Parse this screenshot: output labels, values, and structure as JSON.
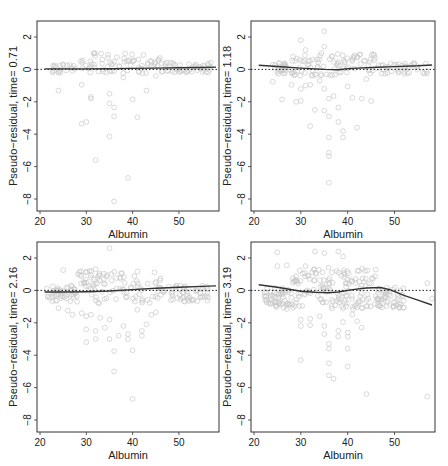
{
  "figure": {
    "panels": 4,
    "layout": "2x2"
  },
  "chart_data": [
    {
      "type": "scatter",
      "title": "",
      "xlabel": "Albumin",
      "ylabel": "Pseudo−residual, time= 0.71",
      "xlim": [
        20,
        58
      ],
      "ylim": [
        -8.5,
        2.9
      ],
      "xticks": [
        20,
        30,
        40,
        50
      ],
      "yticks": [
        2,
        0,
        -2,
        -4,
        -6,
        -8
      ],
      "reference_line": {
        "y": 0,
        "style": "dotted"
      },
      "smooth": {
        "x": [
          21,
          25,
          30,
          35,
          40,
          45,
          50,
          55,
          58
        ],
        "y": [
          0.03,
          0.03,
          0.03,
          0.04,
          0.06,
          0.08,
          0.1,
          0.12,
          0.14
        ]
      },
      "outliers": [
        {
          "x": 24,
          "y": -1.3
        },
        {
          "x": 29,
          "y": -0.95
        },
        {
          "x": 31,
          "y": -1.7
        },
        {
          "x": 31,
          "y": -1.8
        },
        {
          "x": 35,
          "y": -1.5
        },
        {
          "x": 35,
          "y": -2.1
        },
        {
          "x": 36,
          "y": -2.35
        },
        {
          "x": 36,
          "y": -2.9
        },
        {
          "x": 40,
          "y": -1.85
        },
        {
          "x": 41,
          "y": -2.95
        },
        {
          "x": 43,
          "y": -1.3
        },
        {
          "x": 29,
          "y": -3.35
        },
        {
          "x": 30,
          "y": -3.25
        },
        {
          "x": 35,
          "y": -4.15
        },
        {
          "x": 32,
          "y": -5.6
        },
        {
          "x": 39,
          "y": -6.7
        },
        {
          "x": 36,
          "y": -8.15
        },
        {
          "x": 38,
          "y": -0.5
        },
        {
          "x": 45,
          "y": -0.4
        }
      ],
      "cluster": {
        "x_range": [
          22,
          57
        ],
        "y_range": [
          -0.3,
          1.0
        ],
        "count": 140,
        "seed": 11
      }
    },
    {
      "type": "scatter",
      "title": "",
      "xlabel": "Albumin",
      "ylabel": "Pseudo−residual, time= 1.18",
      "xlim": [
        20,
        58
      ],
      "ylim": [
        -8.5,
        2.9
      ],
      "xticks": [
        20,
        30,
        40,
        50
      ],
      "yticks": [
        2,
        0,
        -2,
        -4,
        -6,
        -8
      ],
      "reference_line": {
        "y": 0,
        "style": "dotted"
      },
      "smooth": {
        "x": [
          21,
          25,
          30,
          35,
          38,
          40,
          45,
          50,
          55,
          58
        ],
        "y": [
          0.25,
          0.18,
          0.08,
          0.0,
          -0.02,
          0.05,
          0.12,
          0.17,
          0.22,
          0.27
        ]
      },
      "outliers": [
        {
          "x": 24,
          "y": -0.75
        },
        {
          "x": 26,
          "y": -1.85
        },
        {
          "x": 28,
          "y": -0.95
        },
        {
          "x": 29,
          "y": -2.0
        },
        {
          "x": 30,
          "y": -1.95
        },
        {
          "x": 30,
          "y": -1.2
        },
        {
          "x": 31,
          "y": -1.0
        },
        {
          "x": 32,
          "y": -0.95
        },
        {
          "x": 33,
          "y": -2.5
        },
        {
          "x": 32,
          "y": -3.5
        },
        {
          "x": 34,
          "y": -0.7
        },
        {
          "x": 35,
          "y": -1.2
        },
        {
          "x": 35,
          "y": -2.55
        },
        {
          "x": 36,
          "y": -1.8
        },
        {
          "x": 36,
          "y": -2.9
        },
        {
          "x": 37,
          "y": -1.65
        },
        {
          "x": 38,
          "y": -2.35
        },
        {
          "x": 38,
          "y": -3.25
        },
        {
          "x": 39,
          "y": -3.8
        },
        {
          "x": 39,
          "y": -4.2
        },
        {
          "x": 36,
          "y": -4.2
        },
        {
          "x": 36,
          "y": -5.15
        },
        {
          "x": 36,
          "y": -5.35
        },
        {
          "x": 36,
          "y": -7.0
        },
        {
          "x": 40,
          "y": -1.05
        },
        {
          "x": 41,
          "y": -1.75
        },
        {
          "x": 42,
          "y": -3.6
        },
        {
          "x": 43,
          "y": -1.8
        },
        {
          "x": 45,
          "y": -1.95
        },
        {
          "x": 44,
          "y": -0.6
        },
        {
          "x": 35,
          "y": 2.35
        },
        {
          "x": 30,
          "y": 1.8
        },
        {
          "x": 31,
          "y": 1.2
        },
        {
          "x": 35,
          "y": 1.4
        }
      ],
      "cluster": {
        "x_range": [
          24,
          57
        ],
        "y_range": [
          -0.4,
          1.0
        ],
        "count": 160,
        "seed": 23
      }
    },
    {
      "type": "scatter",
      "title": "",
      "xlabel": "Albumin",
      "ylabel": "Pseudo−residual, time= 2.16",
      "xlim": [
        20,
        58
      ],
      "ylim": [
        -8.5,
        2.9
      ],
      "xticks": [
        20,
        30,
        40,
        50
      ],
      "yticks": [
        2,
        0,
        -2,
        -4,
        -6,
        -8
      ],
      "reference_line": {
        "y": 0,
        "style": "dotted"
      },
      "smooth": {
        "x": [
          21,
          25,
          30,
          35,
          40,
          45,
          50,
          55,
          58
        ],
        "y": [
          -0.1,
          -0.1,
          -0.08,
          -0.04,
          0.05,
          0.13,
          0.2,
          0.25,
          0.28
        ]
      },
      "outliers": [
        {
          "x": 24,
          "y": -1.1
        },
        {
          "x": 26,
          "y": -1.25
        },
        {
          "x": 27,
          "y": -1.5
        },
        {
          "x": 28,
          "y": -0.7
        },
        {
          "x": 29,
          "y": -1.4
        },
        {
          "x": 30,
          "y": -1.6
        },
        {
          "x": 30,
          "y": -2.4
        },
        {
          "x": 30,
          "y": -3.2
        },
        {
          "x": 31,
          "y": -1.5
        },
        {
          "x": 32,
          "y": -2.5
        },
        {
          "x": 32,
          "y": -3.0
        },
        {
          "x": 33,
          "y": -1.7
        },
        {
          "x": 34,
          "y": -2.3
        },
        {
          "x": 35,
          "y": -1.8
        },
        {
          "x": 35,
          "y": -3.0
        },
        {
          "x": 36,
          "y": -3.75
        },
        {
          "x": 36,
          "y": -5.0
        },
        {
          "x": 37,
          "y": -2.8
        },
        {
          "x": 38,
          "y": -2.2
        },
        {
          "x": 39,
          "y": -2.7
        },
        {
          "x": 39,
          "y": -3.0
        },
        {
          "x": 40,
          "y": -3.7
        },
        {
          "x": 40,
          "y": -6.7
        },
        {
          "x": 41,
          "y": -1.2
        },
        {
          "x": 42,
          "y": -2.5
        },
        {
          "x": 42,
          "y": -2.8
        },
        {
          "x": 43,
          "y": -2.1
        },
        {
          "x": 44,
          "y": -1.5
        },
        {
          "x": 45,
          "y": -1.35
        },
        {
          "x": 35,
          "y": 2.6
        },
        {
          "x": 25,
          "y": 1.25
        },
        {
          "x": 32,
          "y": 1.3
        }
      ],
      "cluster": {
        "x_range": [
          21,
          57
        ],
        "y_range": [
          -0.8,
          1.2
        ],
        "count": 200,
        "seed": 37
      }
    },
    {
      "type": "scatter",
      "title": "",
      "xlabel": "Albumin",
      "ylabel": "Pseudo−residual, time= 3.19",
      "xlim": [
        20,
        58
      ],
      "ylim": [
        -8.5,
        2.9
      ],
      "xticks": [
        20,
        30,
        40,
        50
      ],
      "yticks": [
        2,
        0,
        -2,
        -4,
        -6,
        -8
      ],
      "reference_line": {
        "y": 0,
        "style": "dotted"
      },
      "smooth": {
        "x": [
          21,
          25,
          30,
          33,
          36,
          38,
          41,
          44,
          47,
          49,
          52,
          55,
          58
        ],
        "y": [
          0.35,
          0.2,
          -0.05,
          -0.12,
          -0.15,
          -0.1,
          0.05,
          0.15,
          0.18,
          0.05,
          -0.3,
          -0.6,
          -0.9
        ]
      },
      "outliers": [
        {
          "x": 24,
          "y": -0.75
        },
        {
          "x": 26,
          "y": -0.8
        },
        {
          "x": 27,
          "y": -1.15
        },
        {
          "x": 30,
          "y": -1.8
        },
        {
          "x": 30,
          "y": -2.2
        },
        {
          "x": 30,
          "y": -4.3
        },
        {
          "x": 32,
          "y": -1.75
        },
        {
          "x": 32,
          "y": -2.15
        },
        {
          "x": 34,
          "y": -1.6
        },
        {
          "x": 35,
          "y": -2.2
        },
        {
          "x": 35,
          "y": -2.7
        },
        {
          "x": 36,
          "y": -3.3
        },
        {
          "x": 36,
          "y": -3.6
        },
        {
          "x": 36,
          "y": -4.5
        },
        {
          "x": 36,
          "y": -5.25
        },
        {
          "x": 37,
          "y": -5.45
        },
        {
          "x": 38,
          "y": -2.5
        },
        {
          "x": 38,
          "y": -2.85
        },
        {
          "x": 39,
          "y": -1.95
        },
        {
          "x": 40,
          "y": -2.6
        },
        {
          "x": 40,
          "y": -2.85
        },
        {
          "x": 40,
          "y": -3.6
        },
        {
          "x": 40,
          "y": -4.7
        },
        {
          "x": 41,
          "y": -1.5
        },
        {
          "x": 42,
          "y": -1.9
        },
        {
          "x": 43,
          "y": -2.3
        },
        {
          "x": 44,
          "y": -6.4
        },
        {
          "x": 57,
          "y": -6.55
        },
        {
          "x": 25,
          "y": 2.35
        },
        {
          "x": 33,
          "y": 2.4
        },
        {
          "x": 35,
          "y": 2.3
        },
        {
          "x": 38,
          "y": 2.4
        },
        {
          "x": 39,
          "y": 2.1
        },
        {
          "x": 25,
          "y": 1.5
        },
        {
          "x": 27,
          "y": 1.55
        },
        {
          "x": 31,
          "y": 1.5
        },
        {
          "x": 57,
          "y": 0.45
        },
        {
          "x": 58,
          "y": -0.5
        },
        {
          "x": 51,
          "y": -0.85
        }
      ],
      "cluster": {
        "x_range": [
          22,
          52
        ],
        "y_range": [
          -1.2,
          1.4
        ],
        "count": 260,
        "seed": 53
      }
    }
  ],
  "style": {
    "point_color": "#c8c8c8",
    "smooth_color": "#333333",
    "axis_color": "#333333",
    "reference_color": "#222222"
  }
}
